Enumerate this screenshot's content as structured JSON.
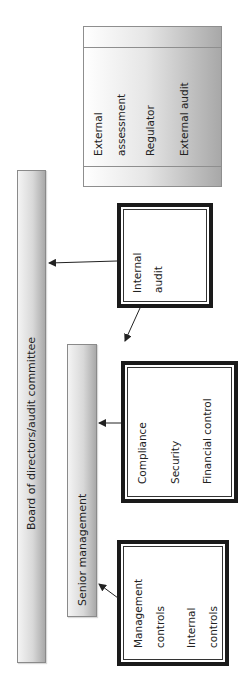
{
  "diagram": {
    "board": {
      "label": "Board of directors/audit committee"
    },
    "senior_management": {
      "label": "Senior management"
    },
    "external": {
      "lines": [
        "External",
        "assessment",
        "Regulator",
        "External audit"
      ]
    },
    "internal_audit": {
      "lines": [
        "Internal",
        "audit"
      ]
    },
    "compliance_box": {
      "lines": [
        "Compliance",
        "Security",
        "Financial control"
      ]
    },
    "management_box": {
      "lines": [
        "Management",
        "controls",
        "Internal",
        "controls"
      ]
    },
    "arrows": [
      {
        "from": "internal_audit",
        "to": "board"
      },
      {
        "from": "internal_audit",
        "to": "senior_management"
      },
      {
        "from": "compliance_box",
        "to": "senior_management"
      },
      {
        "from": "management_box",
        "to": "senior_management"
      }
    ],
    "colors": {
      "box_border": "#1a1a1a",
      "bar_border": "#8a8a8a",
      "bar_gradient_light": "#f4f4f4",
      "bar_gradient_dark": "#a9a9a9",
      "arrow": "#222222"
    }
  }
}
